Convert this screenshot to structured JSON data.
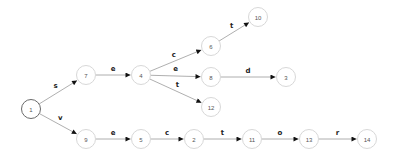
{
  "diagram": {
    "type": "state-transition-graph",
    "nodes": [
      {
        "id": "1",
        "label": "1",
        "x": 31,
        "y": 109,
        "start": true
      },
      {
        "id": "7",
        "label": "7",
        "x": 86,
        "y": 75
      },
      {
        "id": "4",
        "label": "4",
        "x": 141,
        "y": 75
      },
      {
        "id": "6",
        "label": "6",
        "x": 211,
        "y": 46
      },
      {
        "id": "10",
        "label": "10",
        "x": 258,
        "y": 17
      },
      {
        "id": "8",
        "label": "8",
        "x": 211,
        "y": 77
      },
      {
        "id": "3",
        "label": "3",
        "x": 286,
        "y": 77
      },
      {
        "id": "12",
        "label": "12",
        "x": 211,
        "y": 107
      },
      {
        "id": "9",
        "label": "9",
        "x": 86,
        "y": 139
      },
      {
        "id": "5",
        "label": "5",
        "x": 141,
        "y": 139
      },
      {
        "id": "2",
        "label": "2",
        "x": 194,
        "y": 139
      },
      {
        "id": "11",
        "label": "11",
        "x": 252,
        "y": 139
      },
      {
        "id": "13",
        "label": "13",
        "x": 309,
        "y": 139
      },
      {
        "id": "14",
        "label": "14",
        "x": 367,
        "y": 139
      }
    ],
    "edges": [
      {
        "from": "1",
        "to": "7",
        "label": "s"
      },
      {
        "from": "1",
        "to": "9",
        "label": "v"
      },
      {
        "from": "7",
        "to": "4",
        "label": "e"
      },
      {
        "from": "4",
        "to": "6",
        "label": "c"
      },
      {
        "from": "4",
        "to": "8",
        "label": "e"
      },
      {
        "from": "4",
        "to": "12",
        "label": "t"
      },
      {
        "from": "6",
        "to": "10",
        "label": "t"
      },
      {
        "from": "8",
        "to": "3",
        "label": "d"
      },
      {
        "from": "9",
        "to": "5",
        "label": "e"
      },
      {
        "from": "5",
        "to": "2",
        "label": "c"
      },
      {
        "from": "2",
        "to": "11",
        "label": "t"
      },
      {
        "from": "11",
        "to": "13",
        "label": "o"
      },
      {
        "from": "13",
        "to": "14",
        "label": "r"
      }
    ]
  },
  "colors": {
    "edge": "#9a9a9a",
    "node_border": "#d8d8d8",
    "start_node_border": "#6a6a6a",
    "arrowhead": "#111111"
  }
}
